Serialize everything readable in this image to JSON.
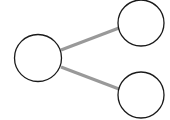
{
  "diagram": {
    "type": "node-link",
    "background": "#ffffff",
    "node_stroke": "#1a1a1a",
    "node_fill": "#ffffff",
    "edge_color": "#999999",
    "nodes": [
      {
        "id": "left",
        "cx": 38,
        "cy": 58,
        "r": 23.5
      },
      {
        "id": "top-right",
        "cx": 141,
        "cy": 23,
        "r": 23
      },
      {
        "id": "bottom-right",
        "cx": 141,
        "cy": 95,
        "r": 23
      }
    ],
    "edges": [
      {
        "from": "left",
        "to": "top-right"
      },
      {
        "from": "left",
        "to": "bottom-right"
      }
    ]
  }
}
